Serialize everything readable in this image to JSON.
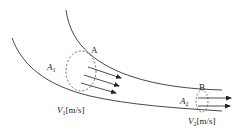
{
  "diagram": {
    "sections": [
      {
        "id": "A",
        "label": "A",
        "area_symbol": "A",
        "area_subscript": "1",
        "velocity_symbol": "V",
        "velocity_subscript": "1",
        "velocity_unit": "[m/s]",
        "arrow_count": 3
      },
      {
        "id": "B",
        "label": "B",
        "area_symbol": "A",
        "area_subscript": "2",
        "velocity_symbol": "V",
        "velocity_subscript": "2",
        "velocity_unit": "[m/s]",
        "arrow_count": 2
      }
    ],
    "colors": {
      "line": "#333333",
      "dashed": "#555555",
      "background": "#ffffff"
    }
  }
}
